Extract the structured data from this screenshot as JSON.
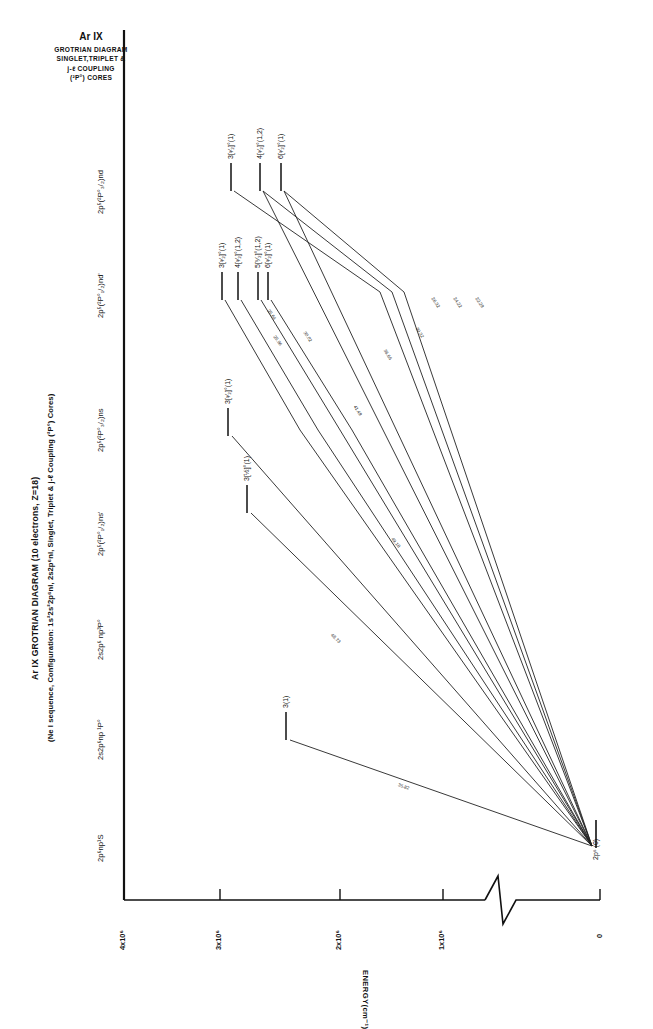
{
  "figure": {
    "title_rot_line1": "Ar IX  GROTRIAN DIAGRAM (10 electrons, Z=18)",
    "title_rot_line2": "(Ne I sequence, Configuration: 1s²2s²2p⁶nl, 2s2p⁶nl, Singlet, Triplet & j-ℓ Coupling (²P°) Cores)",
    "block_title_line1": "Ar IX",
    "block_title_line2": "GROTRIAN DIAGRAM",
    "block_title_line3": "SINGLET,TRIPLET  &",
    "block_title_line4": "j-ℓ COUPLING",
    "block_title_line5": "(²P°) CORES"
  },
  "axis": {
    "title": "ENERGY(cm⁻¹)",
    "ticks": [
      "4x10⁶",
      "3x10⁶",
      "2x10⁶",
      "1x10⁶",
      "0"
    ],
    "tick_values": [
      4000000,
      3000000,
      2000000,
      1000000,
      0
    ],
    "break_symbol": "zigzag-axis-break"
  },
  "columns": [
    {
      "id": "c1",
      "label": "2p⁶np¹S"
    },
    {
      "id": "c2",
      "label": "2s2p⁶np ¹P°"
    },
    {
      "id": "c3",
      "label": "2s2p⁶ np³P°"
    },
    {
      "id": "c4",
      "label": "2p⁵(²P°₁/₂)ns'"
    },
    {
      "id": "c5",
      "label": "2p⁵(²P°₃/₂)ns"
    },
    {
      "id": "c6",
      "label": "2p⁵(²P°₁/₂)nd'"
    },
    {
      "id": "c7",
      "label": "2p⁵(²P°₃/₂)nd"
    }
  ],
  "ground_level": {
    "label": "2p⁶ (0)",
    "energy": 0
  },
  "levels": [
    {
      "col": "c2",
      "label": "3(1)",
      "energy": 2790000
    },
    {
      "col": "c4",
      "label": "3[½]°(1)",
      "energy": 3320000
    },
    {
      "col": "c5",
      "label": "3[³⁄₂]°(1)",
      "energy": 3420000
    },
    {
      "col": "c6",
      "label": "3[³⁄₂]°(1)",
      "energy": 3480000
    },
    {
      "col": "c6",
      "label": "4[³⁄₂]°(1,2)",
      "energy": 3540000
    },
    {
      "col": "c6",
      "label": "5[⁵⁄₂]°(1,2)",
      "energy": 3580000
    },
    {
      "col": "c6",
      "label": "6[³⁄₂]°(1)",
      "energy": 3600000
    },
    {
      "col": "c7",
      "label": "3[³⁄₂]°(1)",
      "energy": 3520000
    },
    {
      "col": "c7",
      "label": "4[³⁄₂]°(1,2)",
      "energy": 3590000
    },
    {
      "col": "c7",
      "label": "6[³⁄₂]°(1)",
      "energy": 3630000
    }
  ],
  "transitions": [
    {
      "wavelength": "35.82"
    },
    {
      "wavelength": "48.73"
    },
    {
      "wavelength": "49.18"
    },
    {
      "wavelength": "41.49"
    },
    {
      "wavelength": "36.66"
    },
    {
      "wavelength": "30.32"
    },
    {
      "wavelength": "30.02"
    },
    {
      "wavelength": "25.96"
    },
    {
      "wavelength": "25.64"
    },
    {
      "wavelength": "26.32"
    },
    {
      "wavelength": "24.22"
    },
    {
      "wavelength": "22.29"
    }
  ],
  "page": {
    "number": ""
  }
}
